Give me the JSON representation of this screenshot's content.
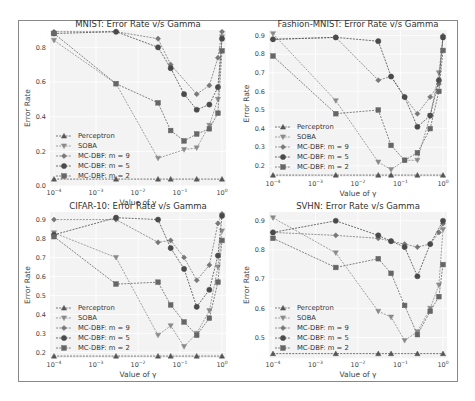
{
  "chart_data": [
    {
      "type": "line",
      "title": "MNIST: Error Rate v/s Gamma",
      "xlabel": "Value of γ",
      "ylabel": "Error Rate",
      "xscale": "log",
      "xlim": [
        0.0001,
        1.0
      ],
      "ylim": [
        0.0,
        0.9
      ],
      "yticks": [
        0.0,
        0.2,
        0.4,
        0.6,
        0.8
      ],
      "xticks": [
        "10^-4",
        "10^-3",
        "10^-2",
        "10^-1",
        "10^0"
      ],
      "grid": true,
      "legend_position": "lower left",
      "series": [
        {
          "name": "Perceptron",
          "marker": "^",
          "x": [
            0.0001,
            0.003,
            0.03,
            0.06,
            0.25,
            1.0
          ],
          "values": [
            0.04,
            0.04,
            0.04,
            0.04,
            0.04,
            0.04
          ]
        },
        {
          "name": "SOBA",
          "marker": "v",
          "x": [
            0.0001,
            0.003,
            0.03,
            0.125,
            0.25,
            0.5,
            0.8,
            1.0
          ],
          "values": [
            0.84,
            0.59,
            0.16,
            0.21,
            0.22,
            0.35,
            0.5,
            0.86
          ]
        },
        {
          "name": "MC-DBF: m = 9",
          "marker": "P",
          "x": [
            0.0001,
            0.003,
            0.03,
            0.06,
            0.25,
            0.5,
            0.8,
            1.0
          ],
          "values": [
            0.89,
            0.89,
            0.85,
            0.7,
            0.53,
            0.58,
            0.74,
            0.89
          ]
        },
        {
          "name": "MC-DBF: m = 5",
          "marker": "o",
          "x": [
            0.0001,
            0.003,
            0.03,
            0.06,
            0.125,
            0.25,
            0.5,
            0.8,
            1.0
          ],
          "values": [
            0.88,
            0.89,
            0.8,
            0.68,
            0.53,
            0.44,
            0.47,
            0.57,
            0.85
          ]
        },
        {
          "name": "MC-DBF: m = 2",
          "marker": "s",
          "x": [
            0.0001,
            0.003,
            0.03,
            0.06,
            0.125,
            0.25,
            0.5,
            0.8,
            1.0
          ],
          "values": [
            0.88,
            0.59,
            0.48,
            0.32,
            0.26,
            0.3,
            0.33,
            0.42,
            0.78
          ]
        }
      ]
    },
    {
      "type": "line",
      "title": "Fashion-MNIST: Error Rate v/s Gamma",
      "xlabel": "Value of γ",
      "ylabel": "Error Rate",
      "xscale": "log",
      "xlim": [
        0.0001,
        1.0
      ],
      "ylim": [
        0.14,
        0.93
      ],
      "yticks": [
        0.2,
        0.3,
        0.4,
        0.5,
        0.6,
        0.7,
        0.8,
        0.9
      ],
      "xticks": [
        "10^-4",
        "10^-3",
        "10^-2",
        "10^-1",
        "10^0"
      ],
      "grid": true,
      "legend_position": "lower left",
      "series": [
        {
          "name": "Perceptron",
          "marker": "^",
          "x": [
            0.0001,
            0.003,
            0.03,
            0.06,
            0.25,
            1.0
          ],
          "values": [
            0.15,
            0.15,
            0.15,
            0.15,
            0.15,
            0.15
          ]
        },
        {
          "name": "SOBA",
          "marker": "v",
          "x": [
            0.0001,
            0.003,
            0.03,
            0.06,
            0.125,
            0.25,
            0.5,
            0.8,
            1.0
          ],
          "values": [
            0.91,
            0.55,
            0.22,
            0.18,
            0.23,
            0.23,
            0.47,
            0.7,
            0.89
          ]
        },
        {
          "name": "MC-DBF: m = 9",
          "marker": "P",
          "x": [
            0.0001,
            0.003,
            0.03,
            0.06,
            0.125,
            0.25,
            0.5,
            0.8,
            1.0
          ],
          "values": [
            0.88,
            0.89,
            0.66,
            0.68,
            0.57,
            0.48,
            0.57,
            0.64,
            0.9
          ]
        },
        {
          "name": "MC-DBF: m = 5",
          "marker": "o",
          "x": [
            0.0001,
            0.003,
            0.03,
            0.06,
            0.125,
            0.25,
            0.5,
            0.8,
            1.0
          ],
          "values": [
            0.88,
            0.89,
            0.87,
            0.68,
            0.57,
            0.41,
            0.47,
            0.66,
            0.89
          ]
        },
        {
          "name": "MC-DBF: m = 2",
          "marker": "s",
          "x": [
            0.0001,
            0.003,
            0.03,
            0.06,
            0.125,
            0.25,
            0.5,
            0.8,
            1.0
          ],
          "values": [
            0.79,
            0.48,
            0.5,
            0.31,
            0.23,
            0.27,
            0.4,
            0.6,
            0.82
          ]
        }
      ]
    },
    {
      "type": "line",
      "title": "CIFAR-10: Error Rate v/s Gamma",
      "xlabel": "Value of γ",
      "ylabel": "Error Rate",
      "xscale": "log",
      "xlim": [
        0.0001,
        1.0
      ],
      "ylim": [
        0.17,
        0.94
      ],
      "yticks": [
        0.2,
        0.3,
        0.4,
        0.5,
        0.6,
        0.7,
        0.8,
        0.9
      ],
      "xticks": [
        "10^-4",
        "10^-3",
        "10^-2",
        "10^-1",
        "10^0"
      ],
      "grid": true,
      "legend_position": "lower left",
      "series": [
        {
          "name": "Perceptron",
          "marker": "^",
          "x": [
            0.0001,
            0.003,
            0.03,
            0.06,
            0.25,
            1.0
          ],
          "values": [
            0.18,
            0.18,
            0.18,
            0.18,
            0.18,
            0.18
          ]
        },
        {
          "name": "SOBA",
          "marker": "v",
          "x": [
            0.0001,
            0.003,
            0.03,
            0.06,
            0.125,
            0.25,
            0.5,
            0.8,
            1.0
          ],
          "values": [
            0.83,
            0.7,
            0.29,
            0.34,
            0.23,
            0.3,
            0.42,
            0.65,
            0.84
          ]
        },
        {
          "name": "MC-DBF: m = 9",
          "marker": "P",
          "x": [
            0.0001,
            0.003,
            0.03,
            0.06,
            0.125,
            0.25,
            0.5,
            0.8,
            1.0
          ],
          "values": [
            0.9,
            0.9,
            0.78,
            0.79,
            0.7,
            0.58,
            0.66,
            0.88,
            0.93
          ]
        },
        {
          "name": "MC-DBF: m = 5",
          "marker": "o",
          "x": [
            0.0001,
            0.003,
            0.03,
            0.06,
            0.125,
            0.25,
            0.5,
            0.8,
            1.0
          ],
          "values": [
            0.82,
            0.91,
            0.9,
            0.75,
            0.64,
            0.44,
            0.53,
            0.71,
            0.92
          ]
        },
        {
          "name": "MC-DBF: m = 2",
          "marker": "s",
          "x": [
            0.0001,
            0.003,
            0.03,
            0.06,
            0.125,
            0.25,
            0.5,
            0.8,
            1.0
          ],
          "values": [
            0.81,
            0.56,
            0.57,
            0.45,
            0.36,
            0.29,
            0.38,
            0.57,
            0.79
          ]
        }
      ]
    },
    {
      "type": "line",
      "title": "SVHN: Error Rate v/s Gamma",
      "xlabel": "Value of γ",
      "ylabel": "Error Rate",
      "xscale": "log",
      "xlim": [
        0.0001,
        1.0
      ],
      "ylim": [
        0.43,
        0.93
      ],
      "yticks": [
        0.5,
        0.6,
        0.7,
        0.8,
        0.9
      ],
      "xticks": [
        "10^-4",
        "10^-3",
        "10^-2",
        "10^-1",
        "10^0"
      ],
      "grid": true,
      "legend_position": "lower left",
      "series": [
        {
          "name": "Perceptron",
          "marker": "^",
          "x": [
            0.0001,
            0.003,
            0.03,
            0.06,
            0.25,
            1.0
          ],
          "values": [
            0.445,
            0.445,
            0.445,
            0.445,
            0.445,
            0.445
          ]
        },
        {
          "name": "SOBA",
          "marker": "v",
          "x": [
            0.0001,
            0.003,
            0.03,
            0.06,
            0.125,
            0.25,
            0.5,
            0.8,
            1.0
          ],
          "values": [
            0.91,
            0.79,
            0.59,
            0.57,
            0.49,
            0.52,
            0.6,
            0.68,
            0.87
          ]
        },
        {
          "name": "MC-DBF: m = 9",
          "marker": "P",
          "x": [
            0.0001,
            0.003,
            0.03,
            0.06,
            0.125,
            0.25,
            0.5,
            0.8,
            1.0
          ],
          "values": [
            0.86,
            0.85,
            0.84,
            0.83,
            0.82,
            0.81,
            0.82,
            0.86,
            0.89
          ]
        },
        {
          "name": "MC-DBF: m = 5",
          "marker": "o",
          "x": [
            0.0001,
            0.003,
            0.03,
            0.06,
            0.125,
            0.25,
            0.5,
            1.0
          ],
          "values": [
            0.86,
            0.9,
            0.85,
            0.83,
            0.81,
            0.71,
            0.82,
            0.9
          ]
        },
        {
          "name": "MC-DBF: m = 2",
          "marker": "s",
          "x": [
            0.0001,
            0.003,
            0.03,
            0.06,
            0.125,
            0.25,
            0.5,
            0.8,
            1.0
          ],
          "values": [
            0.84,
            0.74,
            0.77,
            0.72,
            0.61,
            0.51,
            0.59,
            0.64,
            0.75
          ]
        }
      ]
    }
  ],
  "panels": [
    {
      "title": "MNIST: Error Rate v/s Gamma",
      "ylabel": "Error Rate",
      "xlabel": "Value of γ"
    },
    {
      "title": "Fashion-MNIST: Error Rate v/s Gamma",
      "ylabel": "Error Rate",
      "xlabel": "Value of γ"
    },
    {
      "title": "CIFAR-10: Error Rate v/s Gamma",
      "ylabel": "Error Rate",
      "xlabel": "Value of γ"
    },
    {
      "title": "SVHN: Error Rate v/s Gamma",
      "ylabel": "Error Rate",
      "xlabel": "Value of γ"
    }
  ],
  "legend": [
    "Perceptron",
    "SOBA",
    "MC-DBF: m = 9",
    "MC-DBF: m = 5",
    "MC-DBF: m = 2"
  ],
  "colors": {
    "Perceptron": "#555555",
    "SOBA": "#8a8a8a",
    "MC-DBF: m = 9": "#777777",
    "MC-DBF: m = 5": "#4a4a4a",
    "MC-DBF: m = 2": "#666666",
    "plot_bg": "#f3f3f3",
    "grid": "#ffffff",
    "frame": "#888888"
  }
}
